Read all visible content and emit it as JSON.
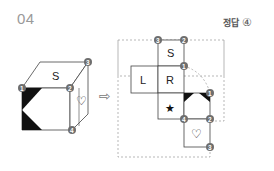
{
  "problem": {
    "number": "04",
    "answer_label": "정답",
    "answer_value": "④"
  },
  "cube": {
    "top_face_label": "S",
    "right_face_symbol": "♡",
    "front_face_pattern": "black-corner-triangles",
    "vertex_markers": [
      "1",
      "2",
      "3",
      "4"
    ]
  },
  "arrow": "⇨",
  "net": {
    "faces": [
      {
        "label": "S",
        "vertices": [
          "3",
          "2"
        ]
      },
      {
        "label": "L"
      },
      {
        "label": "R",
        "vertices": [
          "1"
        ]
      },
      {
        "label": "★"
      },
      {
        "label": "black-triangles",
        "vertices": [
          "1",
          "2",
          "4"
        ]
      },
      {
        "label": "♡",
        "vertices": [
          "3"
        ]
      }
    ]
  },
  "colors": {
    "marker_fill": "#6e6e6e",
    "line": "#444444",
    "dashed": "#9a9a9a",
    "fill_black": "#111111"
  }
}
